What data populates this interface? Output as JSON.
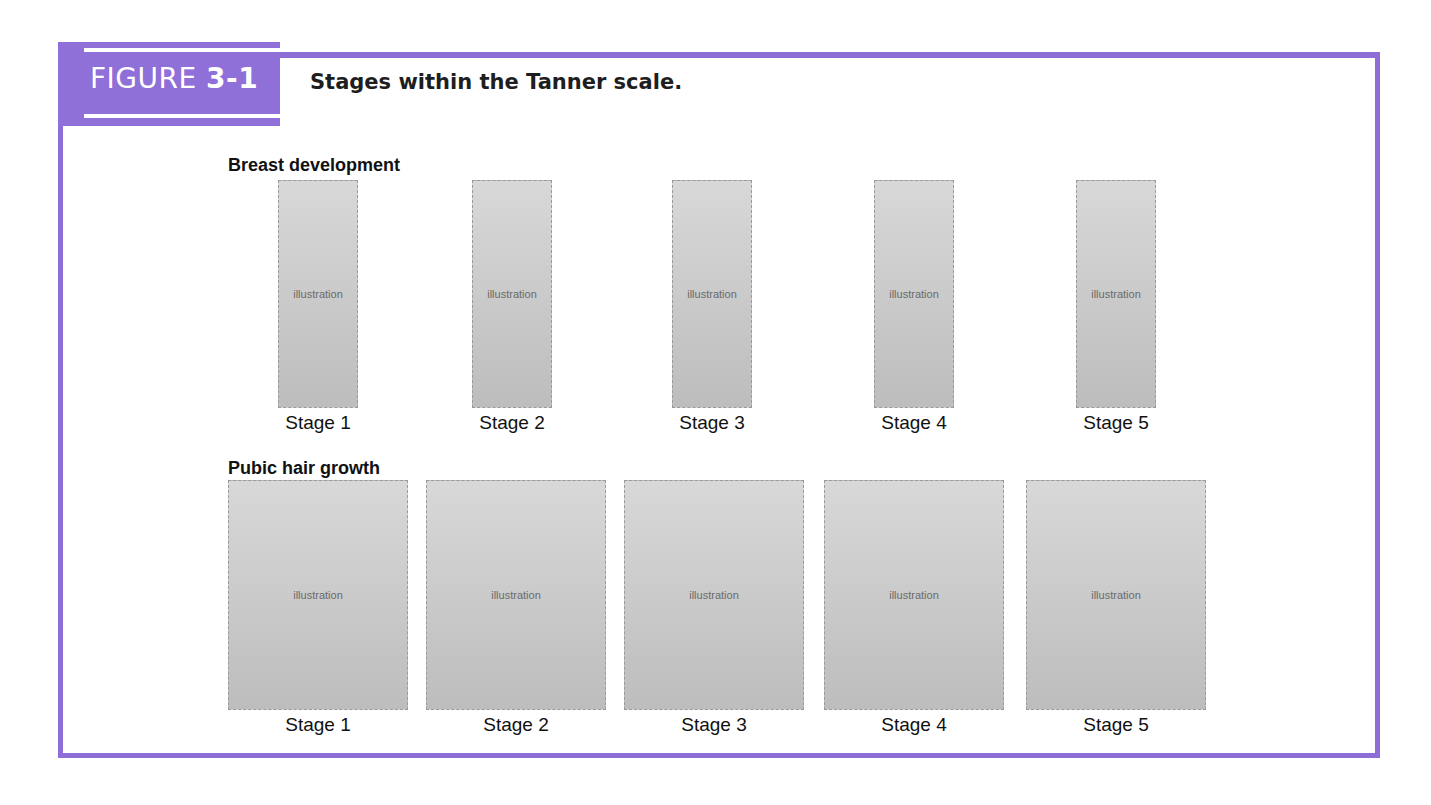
{
  "figure": {
    "tab_prefix": "FIGURE ",
    "tab_number": "3-1",
    "caption": "Stages within the Tanner scale.",
    "accent_color": "#8f6fd8"
  },
  "sections": [
    {
      "title": "Breast development",
      "view": "side profile",
      "stages": [
        "Stage 1",
        "Stage 2",
        "Stage 3",
        "Stage 4",
        "Stage 5"
      ]
    },
    {
      "title": "Pubic hair growth",
      "view": "front",
      "stages": [
        "Stage 1",
        "Stage 2",
        "Stage 3",
        "Stage 4",
        "Stage 5"
      ]
    }
  ],
  "placeholder_text": "illustration"
}
